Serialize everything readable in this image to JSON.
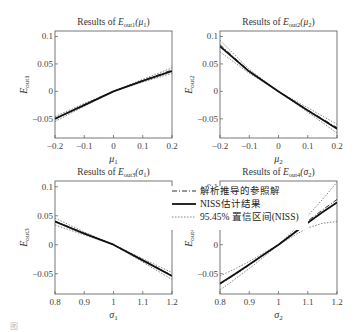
{
  "figure": {
    "caption": "图"
  },
  "legend": {
    "items": [
      {
        "label": "解析推导的参照解",
        "style": "dashdot"
      },
      {
        "label": "NISS估计结果",
        "style": "solid-bold"
      },
      {
        "label": "95.45% 置信区间(NISS)",
        "style": "dotted"
      }
    ]
  },
  "chart_data": [
    {
      "type": "line",
      "title": "Results of E_out1(μ1)",
      "title_prefix": "Results of ",
      "title_sym": "E",
      "title_sub": "out1",
      "title_arg": "(μ",
      "title_arg_sub": "1",
      "xlabel": "μ1",
      "xlabel_sym": "μ",
      "xlabel_sub": "1",
      "ylabel": "E_out1",
      "ylabel_sub": "out1",
      "xlim": [
        -0.2,
        0.2
      ],
      "ylim": [
        -0.085,
        0.11
      ],
      "xticks": [
        -0.2,
        -0.1,
        0,
        0.1,
        0.2
      ],
      "xtick_labels": [
        "−0.2",
        "−0.1",
        "0",
        "0.1",
        "0.2"
      ],
      "yticks": [
        0.1,
        0.05,
        0,
        -0.05
      ],
      "ytick_labels": [
        "0.1",
        "0.05",
        "0",
        "−0.05"
      ],
      "x": [
        -0.2,
        -0.1,
        0,
        0.1,
        0.2
      ],
      "series": [
        {
          "name": "解析推导的参照解",
          "values": [
            -0.05,
            -0.024,
            0,
            0.02,
            0.039
          ]
        },
        {
          "name": "NISS估计结果",
          "values": [
            -0.05,
            -0.025,
            0,
            0.019,
            0.037
          ]
        },
        {
          "name": "95.45% 置信区间上限",
          "values": [
            -0.046,
            -0.022,
            0,
            0.022,
            0.043
          ]
        },
        {
          "name": "95.45% 置信区间下限",
          "values": [
            -0.055,
            -0.027,
            0,
            0.017,
            0.033
          ]
        }
      ]
    },
    {
      "type": "line",
      "title": "Results of E_out2(μ2)",
      "title_prefix": "Results of ",
      "title_sym": "E",
      "title_sub": "out2",
      "title_arg": "(μ",
      "title_arg_sub": "2",
      "xlabel": "μ2",
      "xlabel_sym": "μ",
      "xlabel_sub": "2",
      "ylabel": "E_out2",
      "ylabel_sub": "out2",
      "xlim": [
        -0.2,
        0.2
      ],
      "ylim": [
        -0.085,
        0.11
      ],
      "xticks": [
        -0.2,
        -0.1,
        0,
        0.1,
        0.2
      ],
      "xtick_labels": [
        "−0.2",
        "−0.1",
        "0",
        "0.1",
        "0.2"
      ],
      "yticks": [
        0.1,
        0.05,
        0,
        -0.05
      ],
      "ytick_labels": [
        "0.1",
        "0.05",
        "0",
        "−0.05"
      ],
      "x": [
        -0.2,
        -0.1,
        0,
        0.1,
        0.2
      ],
      "series": [
        {
          "name": "解析推导的参照解",
          "values": [
            0.085,
            0.037,
            0,
            -0.034,
            -0.066
          ]
        },
        {
          "name": "NISS估计结果",
          "values": [
            0.082,
            0.036,
            0,
            -0.035,
            -0.068
          ]
        },
        {
          "name": "95.45% 置信区间上限",
          "values": [
            0.093,
            0.04,
            0,
            -0.03,
            -0.06
          ]
        },
        {
          "name": "95.45% 置信区间下限",
          "values": [
            0.072,
            0.033,
            0,
            -0.038,
            -0.076
          ]
        }
      ]
    },
    {
      "type": "line",
      "title": "Results of E_out3(σ1)",
      "title_prefix": "Results of ",
      "title_sym": "E",
      "title_sub": "out3",
      "title_arg": "(σ",
      "title_arg_sub": "1",
      "xlabel": "σ1",
      "xlabel_sym": "σ",
      "xlabel_sub": "1",
      "ylabel": "E_out3",
      "ylabel_sub": "out3",
      "xlim": [
        0.8,
        1.2
      ],
      "ylim": [
        -0.085,
        0.11
      ],
      "xticks": [
        0.8,
        0.9,
        1,
        1.1,
        1.2
      ],
      "xtick_labels": [
        "0.8",
        "0.9",
        "1",
        "1.1",
        "1.2"
      ],
      "yticks": [
        0.1,
        0.05,
        0,
        -0.05
      ],
      "ytick_labels": [
        "0.1",
        "0.05",
        "0",
        "−0.05"
      ],
      "x": [
        0.8,
        0.9,
        1.0,
        1.1,
        1.2
      ],
      "series": [
        {
          "name": "解析推导的参照解",
          "values": [
            0.041,
            0.02,
            0,
            -0.026,
            -0.053
          ]
        },
        {
          "name": "NISS估计结果",
          "values": [
            0.04,
            0.019,
            0,
            -0.027,
            -0.054
          ]
        },
        {
          "name": "95.45% 置信区间上限",
          "values": [
            0.046,
            0.022,
            0,
            -0.024,
            -0.048
          ]
        },
        {
          "name": "95.45% 置信区间下限",
          "values": [
            0.034,
            0.017,
            0,
            -0.03,
            -0.06
          ]
        }
      ]
    },
    {
      "type": "line",
      "title": "Results of E_out4(σ2)",
      "title_prefix": "Results of ",
      "title_sym": "E",
      "title_sub": "out4",
      "title_arg": "(σ",
      "title_arg_sub": "2",
      "xlabel": "σ2",
      "xlabel_sym": "σ",
      "xlabel_sub": "2",
      "ylabel": "E_out4",
      "ylabel_sub": "out4",
      "xlim": [
        0.8,
        1.2
      ],
      "ylim": [
        -0.085,
        0.11
      ],
      "xticks": [
        0.8,
        0.9,
        1,
        1.1,
        1.2
      ],
      "xtick_labels": [
        "0.8",
        "0.9",
        "1",
        "1.1",
        "1.2"
      ],
      "yticks": [
        0.1,
        0.05,
        0,
        -0.05
      ],
      "ytick_labels": [
        "0.1",
        "0.05",
        "0",
        "−0.05"
      ],
      "x": [
        0.8,
        0.85,
        0.9,
        0.95,
        1.0,
        1.05,
        1.1,
        1.15,
        1.2
      ],
      "series": [
        {
          "name": "解析推导的参照解",
          "values": [
            -0.068,
            -0.052,
            -0.035,
            -0.017,
            0,
            0.02,
            0.041,
            0.06,
            0.078
          ]
        },
        {
          "name": "NISS估计结果",
          "values": [
            -0.067,
            -0.051,
            -0.034,
            -0.017,
            0,
            0.019,
            0.038,
            0.056,
            0.073
          ]
        },
        {
          "name": "95.45% 置信区间上限",
          "values": [
            -0.078,
            -0.06,
            -0.041,
            -0.021,
            0,
            0.024,
            0.05,
            0.078,
            0.108
          ]
        },
        {
          "name": "95.45% 置信区间下限",
          "values": [
            -0.054,
            -0.042,
            -0.029,
            -0.014,
            0,
            0.015,
            0.029,
            0.037,
            0.04
          ]
        }
      ]
    }
  ]
}
